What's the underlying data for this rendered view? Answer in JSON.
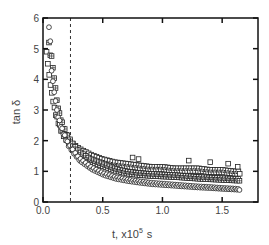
{
  "chart_data": {
    "type": "scatter",
    "title": "",
    "xlabel": "t, x10^5 s",
    "xlabel_main": "t, x10",
    "xlabel_exp": "5",
    "xlabel_unit": "s",
    "ylabel": "tan δ",
    "xlim": [
      0.0,
      1.8
    ],
    "ylim": [
      0,
      6
    ],
    "xticks": [
      "0.0",
      "0.5",
      "1.0",
      "1.5"
    ],
    "yticks": [
      "0",
      "1",
      "2",
      "3",
      "4",
      "5",
      "6"
    ],
    "grid": false,
    "legend": null,
    "annotations": [
      {
        "type": "vertical-dashed-line",
        "x": 0.23
      }
    ],
    "series": [
      {
        "name": "upper (open squares)",
        "marker": "square",
        "x": [
          0.03,
          0.05,
          0.08,
          0.1,
          0.15,
          0.2,
          0.25,
          0.3,
          0.4,
          0.5,
          0.6,
          0.7,
          0.8,
          0.9,
          1.0,
          1.1,
          1.2,
          1.3,
          1.4,
          1.5,
          1.6,
          1.65
        ],
        "y": [
          4.9,
          4.2,
          3.4,
          3.0,
          2.4,
          2.1,
          1.9,
          1.75,
          1.55,
          1.4,
          1.3,
          1.25,
          1.2,
          1.15,
          1.15,
          1.1,
          1.1,
          1.1,
          1.05,
          1.05,
          1.0,
          1.0
        ]
      },
      {
        "name": "scattered outliers (open squares)",
        "marker": "square",
        "x": [
          0.32,
          0.36,
          0.75,
          0.8,
          1.22,
          1.4,
          1.55,
          1.63
        ],
        "y": [
          1.35,
          1.35,
          1.45,
          1.4,
          1.35,
          1.3,
          1.25,
          1.15
        ]
      },
      {
        "name": "middle (crossed squares)",
        "marker": "crossed-square",
        "x": [
          0.05,
          0.08,
          0.1,
          0.12,
          0.15,
          0.2,
          0.25,
          0.3,
          0.4,
          0.5,
          0.6,
          0.7,
          0.8,
          0.9,
          1.0,
          1.1,
          1.2,
          1.3,
          1.4,
          1.5,
          1.6,
          1.65
        ],
        "y": [
          5.2,
          4.6,
          3.8,
          3.2,
          2.7,
          2.2,
          1.9,
          1.65,
          1.4,
          1.25,
          1.1,
          1.0,
          0.95,
          0.92,
          0.9,
          0.88,
          0.85,
          0.82,
          0.8,
          0.78,
          0.76,
          0.75
        ]
      },
      {
        "name": "lower (circles)",
        "marker": "circle",
        "x": [
          0.05,
          0.06,
          0.08,
          0.1,
          0.12,
          0.15,
          0.2,
          0.25,
          0.3,
          0.4,
          0.5,
          0.6,
          0.7,
          0.8,
          0.9,
          1.0,
          1.1,
          1.2,
          1.3,
          1.4,
          1.5,
          1.6,
          1.65
        ],
        "y": [
          5.7,
          4.7,
          4.0,
          3.4,
          2.9,
          2.5,
          2.0,
          1.7,
          1.45,
          1.15,
          0.95,
          0.82,
          0.74,
          0.68,
          0.63,
          0.6,
          0.57,
          0.54,
          0.51,
          0.49,
          0.46,
          0.44,
          0.42
        ]
      }
    ]
  }
}
